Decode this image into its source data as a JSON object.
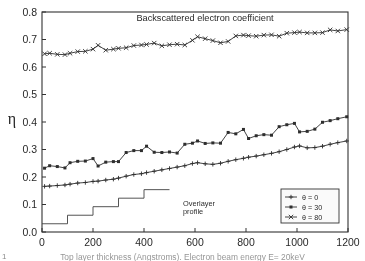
{
  "figure": {
    "title": "Backscattered electron coefficient",
    "caption": "Top layer thickness (Angstroms). Electron beam energy E= 20keV",
    "figure_mark": "1"
  },
  "annotations": {
    "overlayer_line1": "Overlayer",
    "overlayer_line2": "profile"
  },
  "legend": {
    "items": [
      {
        "label": "θ = 0",
        "marker": "plus"
      },
      {
        "label": "θ = 30",
        "marker": "square"
      },
      {
        "label": "θ = 80",
        "marker": "cross"
      }
    ]
  },
  "axes": {
    "x_ticklabels": [
      "0",
      "200",
      "400",
      "600",
      "800",
      "1000",
      "1200"
    ],
    "y_ticklabels": [
      "0.0",
      "0.1",
      "0.2",
      "0.3",
      "0.4",
      "0.5",
      "0.6",
      "0.7",
      "0.8"
    ],
    "y_axis_symbol": "η"
  },
  "chart_data": {
    "type": "line",
    "title": "Backscattered electron coefficient",
    "xlabel": "Top layer thickness (Angstroms). Electron beam energy E= 20keV",
    "ylabel": "η",
    "xlim": [
      0,
      1200
    ],
    "ylim": [
      0.0,
      0.8
    ],
    "xticks": [
      0,
      200,
      400,
      600,
      800,
      1000,
      1200
    ],
    "yticks": [
      0.0,
      0.1,
      0.2,
      0.3,
      0.4,
      0.5,
      0.6,
      0.7,
      0.8
    ],
    "grid": false,
    "legend_position": "lower right",
    "series": [
      {
        "name": "θ = 0",
        "marker": "plus",
        "x": [
          10,
          30,
          60,
          90,
          110,
          140,
          170,
          200,
          220,
          250,
          280,
          300,
          330,
          360,
          390,
          410,
          440,
          470,
          500,
          530,
          560,
          590,
          610,
          640,
          670,
          700,
          730,
          760,
          790,
          810,
          840,
          870,
          900,
          930,
          960,
          990,
          1010,
          1040,
          1070,
          1100,
          1130,
          1160,
          1195
        ],
        "y": [
          0.166,
          0.167,
          0.169,
          0.171,
          0.174,
          0.178,
          0.18,
          0.184,
          0.185,
          0.189,
          0.192,
          0.196,
          0.203,
          0.209,
          0.212,
          0.216,
          0.221,
          0.226,
          0.231,
          0.236,
          0.241,
          0.249,
          0.252,
          0.248,
          0.246,
          0.25,
          0.257,
          0.263,
          0.268,
          0.272,
          0.276,
          0.281,
          0.286,
          0.292,
          0.3,
          0.309,
          0.313,
          0.306,
          0.307,
          0.312,
          0.319,
          0.325,
          0.331
        ]
      },
      {
        "name": "θ = 30",
        "marker": "square",
        "x": [
          10,
          30,
          60,
          90,
          110,
          140,
          170,
          200,
          220,
          250,
          280,
          300,
          330,
          360,
          390,
          410,
          440,
          470,
          500,
          530,
          560,
          590,
          610,
          640,
          670,
          700,
          730,
          760,
          790,
          810,
          840,
          870,
          900,
          930,
          960,
          990,
          1010,
          1040,
          1070,
          1100,
          1130,
          1160,
          1195
        ],
        "y": [
          0.232,
          0.241,
          0.238,
          0.233,
          0.252,
          0.257,
          0.258,
          0.267,
          0.24,
          0.254,
          0.256,
          0.256,
          0.289,
          0.296,
          0.296,
          0.312,
          0.29,
          0.289,
          0.291,
          0.287,
          0.319,
          0.323,
          0.331,
          0.322,
          0.324,
          0.323,
          0.362,
          0.357,
          0.373,
          0.34,
          0.35,
          0.354,
          0.352,
          0.383,
          0.39,
          0.395,
          0.364,
          0.366,
          0.374,
          0.399,
          0.405,
          0.412,
          0.419
        ]
      },
      {
        "name": "θ = 80",
        "marker": "cross",
        "x": [
          10,
          30,
          60,
          90,
          110,
          140,
          170,
          200,
          220,
          250,
          280,
          300,
          330,
          360,
          390,
          410,
          440,
          470,
          500,
          530,
          560,
          590,
          610,
          640,
          670,
          700,
          730,
          760,
          790,
          810,
          840,
          870,
          900,
          930,
          960,
          990,
          1010,
          1040,
          1070,
          1100,
          1130,
          1160,
          1195
        ],
        "y": [
          0.648,
          0.65,
          0.646,
          0.645,
          0.65,
          0.656,
          0.657,
          0.665,
          0.679,
          0.661,
          0.665,
          0.668,
          0.67,
          0.678,
          0.68,
          0.682,
          0.687,
          0.677,
          0.681,
          0.683,
          0.68,
          0.697,
          0.71,
          0.703,
          0.696,
          0.688,
          0.693,
          0.713,
          0.716,
          0.714,
          0.712,
          0.716,
          0.717,
          0.712,
          0.723,
          0.725,
          0.727,
          0.724,
          0.724,
          0.725,
          0.735,
          0.731,
          0.736
        ]
      }
    ],
    "overlayer_profile": {
      "label": "Overlayer profile",
      "type": "step",
      "x": [
        0,
        100,
        100,
        200,
        200,
        300,
        300,
        400,
        400,
        500
      ],
      "y": [
        0.03,
        0.03,
        0.061,
        0.061,
        0.092,
        0.092,
        0.123,
        0.123,
        0.154,
        0.154
      ]
    }
  }
}
